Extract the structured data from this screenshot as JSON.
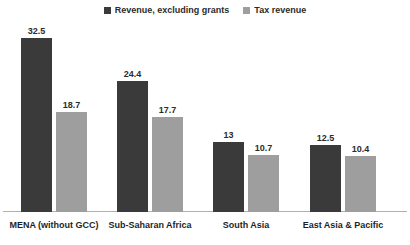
{
  "chart_data": {
    "type": "bar",
    "title": "",
    "subtitle": "",
    "xlabel": "",
    "ylabel": "",
    "grid": false,
    "legend_position": "top-center",
    "axis_visible": {
      "x": true,
      "y": false
    },
    "ylim": [
      0,
      35
    ],
    "categories": [
      "MENA (without GCC)",
      "Sub-Saharan Africa",
      "South Asia",
      "East Asia & Pacific"
    ],
    "series": [
      {
        "name": "Revenue, excluding grants",
        "color": "#3a3a3a",
        "values": [
          32.5,
          24.4,
          13,
          12.5
        ],
        "value_labels": [
          "32.5",
          "24.4",
          "13",
          "12.5"
        ]
      },
      {
        "name": "Tax revenue",
        "color": "#9e9e9e",
        "values": [
          18.7,
          17.7,
          10.7,
          10.4
        ],
        "value_labels": [
          "18.7",
          "17.7",
          "10.7",
          "10.4"
        ]
      }
    ]
  },
  "legend": {
    "entries": [
      {
        "label": "Revenue, excluding grants",
        "swatch": "dark-square-swatch",
        "color": "#3a3a3a"
      },
      {
        "label": "Tax revenue",
        "swatch": "gray-square-swatch",
        "color": "#9e9e9e"
      }
    ]
  },
  "axis": {
    "baseline_color": "#b0b0b0"
  }
}
